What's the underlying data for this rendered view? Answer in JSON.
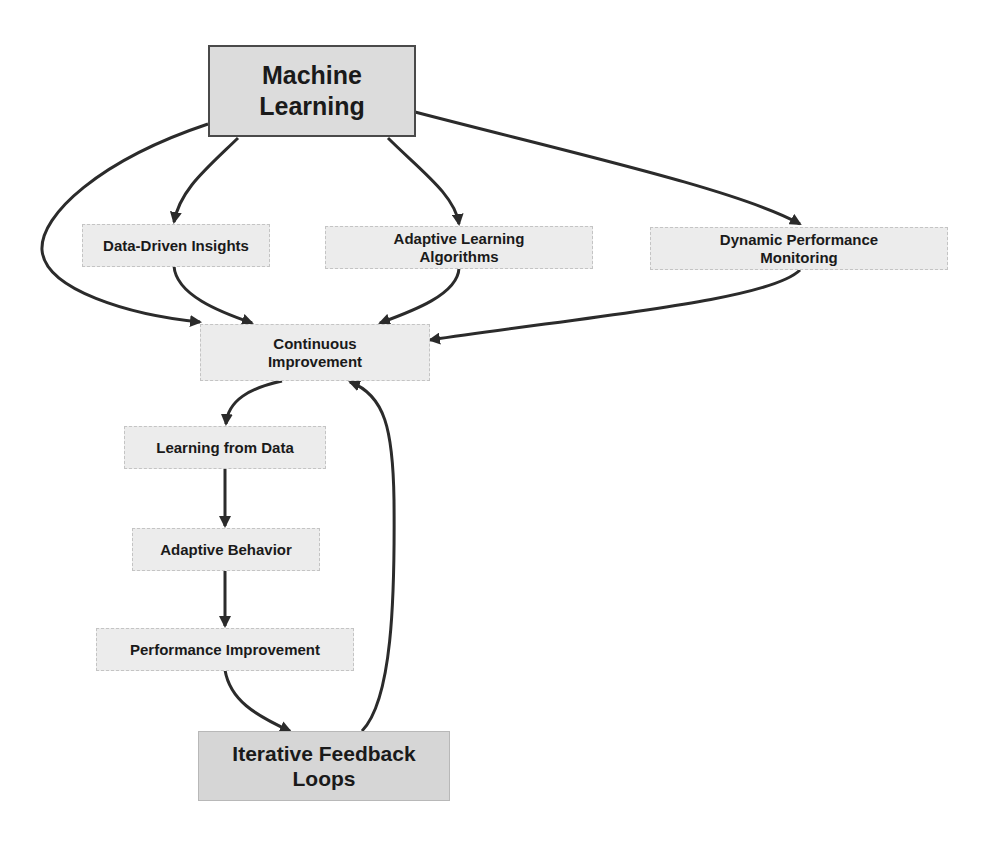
{
  "diagram": {
    "type": "flowchart",
    "colors": {
      "edge": "#2b2b2b",
      "primary_fill": "#dcdcdc",
      "primary_border": "#4a4a4a",
      "node_fill": "#ececec",
      "node_border": "#c4c4c4",
      "terminal_fill": "#d6d6d6"
    },
    "nodes": {
      "machine_learning": {
        "label": "Machine\nLearning"
      },
      "data_driven_insights": {
        "label": "Data-Driven Insights"
      },
      "adaptive_learning_algorithms": {
        "label": "Adaptive Learning\nAlgorithms"
      },
      "dynamic_performance_monitoring": {
        "label": "Dynamic Performance\nMonitoring"
      },
      "continuous_improvement": {
        "label": "Continuous\nImprovement"
      },
      "learning_from_data": {
        "label": "Learning from Data"
      },
      "adaptive_behavior": {
        "label": "Adaptive Behavior"
      },
      "performance_improvement": {
        "label": "Performance Improvement"
      },
      "iterative_feedback_loops": {
        "label": "Iterative Feedback\nLoops"
      }
    },
    "edges": [
      {
        "from": "Machine Learning",
        "to": "Data-Driven Insights"
      },
      {
        "from": "Machine Learning",
        "to": "Adaptive Learning Algorithms"
      },
      {
        "from": "Machine Learning",
        "to": "Dynamic Performance Monitoring"
      },
      {
        "from": "Machine Learning",
        "to": "Continuous Improvement"
      },
      {
        "from": "Data-Driven Insights",
        "to": "Continuous Improvement"
      },
      {
        "from": "Adaptive Learning Algorithms",
        "to": "Continuous Improvement"
      },
      {
        "from": "Dynamic Performance Monitoring",
        "to": "Continuous Improvement"
      },
      {
        "from": "Continuous Improvement",
        "to": "Learning from Data"
      },
      {
        "from": "Learning from Data",
        "to": "Adaptive Behavior"
      },
      {
        "from": "Adaptive Behavior",
        "to": "Performance Improvement"
      },
      {
        "from": "Performance Improvement",
        "to": "Iterative Feedback Loops"
      },
      {
        "from": "Iterative Feedback Loops",
        "to": "Continuous Improvement"
      }
    ]
  }
}
